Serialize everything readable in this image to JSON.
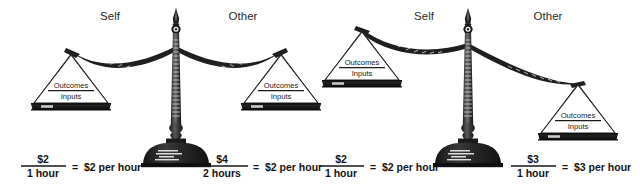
{
  "figure": {
    "background_color": "#ffffff",
    "ink_color": "#1f1f1f"
  },
  "scales": [
    {
      "id": "scale-left",
      "state": "balanced",
      "columns": [
        {
          "heading": "Self",
          "pan": {
            "numerator": "Outcomes",
            "denominator": "Inputs"
          },
          "formula": {
            "numerator": "$2",
            "denominator": "1 hour",
            "equals": "=",
            "result": "$2 per hour"
          }
        },
        {
          "heading": "Other",
          "pan": {
            "numerator": "Outcomes",
            "denominator": "Inputs"
          },
          "formula": {
            "numerator": "$4",
            "denominator": "2 hours",
            "equals": "=",
            "result": "$2 per hour"
          }
        }
      ]
    },
    {
      "id": "scale-right",
      "state": "tilted-right",
      "columns": [
        {
          "heading": "Self",
          "pan": {
            "numerator": "Outcomes",
            "denominator": "Inputs"
          },
          "formula": {
            "numerator": "$2",
            "denominator": "1 hour",
            "equals": "=",
            "result": "$2 per hour"
          }
        },
        {
          "heading": "Other",
          "pan": {
            "numerator": "Outcomes",
            "denominator": "Inputs"
          },
          "formula": {
            "numerator": "$3",
            "denominator": "1 hour",
            "equals": "=",
            "result": "$3 per hour"
          }
        }
      ]
    }
  ],
  "icons": {
    "balance_scale": "balance-scale-icon",
    "pan": "scale-pan-icon",
    "pillar": "scale-pillar-icon",
    "finial": "scale-finial-icon",
    "base": "scale-base-icon"
  }
}
